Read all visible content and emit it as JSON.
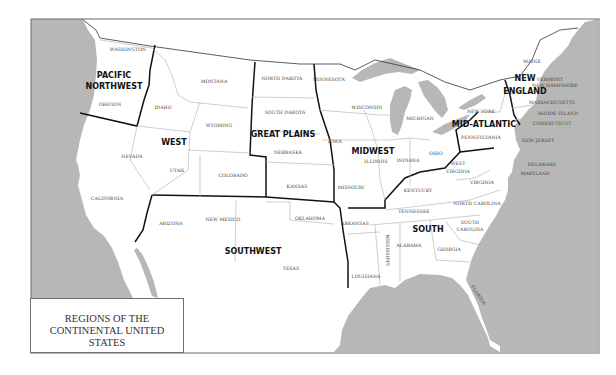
{
  "map": {
    "title_lines": [
      "REGIONS OF THE",
      "CONTINENTAL UNITED STATES"
    ],
    "colors": {
      "water": "#b7b7b7",
      "land": "#ffffff",
      "region_border": "#111111",
      "state_border": "#b9b9b9",
      "label": "#444444"
    },
    "regions": [
      {
        "id": "pacific-northwest",
        "label_lines": [
          "PACIFIC",
          "NORTHWEST"
        ]
      },
      {
        "id": "west",
        "label_lines": [
          "WEST"
        ]
      },
      {
        "id": "great-plains",
        "label_lines": [
          "GREAT PLAINS"
        ]
      },
      {
        "id": "midwest",
        "label_lines": [
          "MIDWEST"
        ]
      },
      {
        "id": "mid-atlantic",
        "label_lines": [
          "MID-ATLANTIC"
        ]
      },
      {
        "id": "new-england",
        "label_lines": [
          "NEW",
          "ENGLAND"
        ]
      },
      {
        "id": "southwest",
        "label_lines": [
          "SOUTHWEST"
        ]
      },
      {
        "id": "south",
        "label_lines": [
          "SOUTH"
        ]
      }
    ],
    "states": {
      "washington": "WASHINGTON",
      "oregon": "OREGON",
      "idaho": "IDAHO",
      "montana": "MONTANA",
      "wyoming": "WYOMING",
      "nevada": "NEVADA",
      "utah": "UTAH",
      "colorado": "COLORADO",
      "california": "CALIFORNIA",
      "north_dakota": "NORTH DAKOTA",
      "south_dakota": "SOUTH DAKOTA",
      "nebraska": "NEBRASKA",
      "kansas": "KANSAS",
      "minnesota": "MINNESOTA",
      "wisconsin": "WISCONSIN",
      "michigan": "MICHIGAN",
      "iowa": "IOWA",
      "illinois": "ILLINOIS",
      "indiana": "INDIANA",
      "ohio": "OHIO",
      "missouri": "MISSOURI",
      "kentucky": "KENTUCKY",
      "new_york": "NEW YORK",
      "pennsylvania": "PENNSYLVANIA",
      "new_jersey": "NEW JERSEY",
      "delaware": "DELAWARE",
      "maryland": "MARYLAND",
      "maine": "MAINE",
      "vermont": "VERMONT",
      "new_hampshire": "NEW HAMPSHIRE",
      "massachusetts": "MASSACHUSETTS",
      "rhode_island": "RHODE ISLAND",
      "connecticut": "CONNECTICUT",
      "arizona": "ARIZONA",
      "new_mexico": "NEW MEXICO",
      "oklahoma": "OKLAHOMA",
      "texas": "TEXAS",
      "arkansas": "ARKANSAS",
      "louisiana": "LOUISIANA",
      "mississippi": "MISSISSIPPI",
      "alabama": "ALABAMA",
      "georgia": "GEORGIA",
      "tennessee": "TENNESSEE",
      "north_carolina": "NORTH CAROLINA",
      "south_carolina_1": "SOUTH",
      "south_carolina_2": "CAROLINA",
      "west_virginia_1": "WEST",
      "west_virginia_2": "VIRGINIA",
      "virginia": "VIRGINIA",
      "florida": "FLORIDA"
    }
  }
}
